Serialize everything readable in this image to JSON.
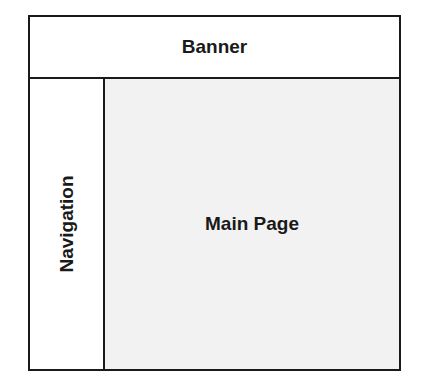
{
  "diagram": {
    "banner": {
      "label": "Banner"
    },
    "navigation": {
      "label": "Navigation"
    },
    "main": {
      "label": "Main Page"
    }
  },
  "colors": {
    "border": "#1a1a1a",
    "main_fill": "#f2f2f2",
    "background": "#ffffff"
  }
}
